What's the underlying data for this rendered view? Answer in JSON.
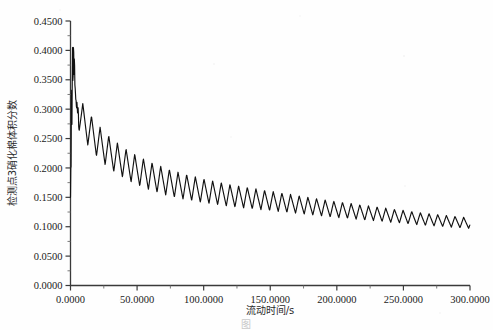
{
  "figure": {
    "background_color": "#fefefe",
    "ink_color": "#111111",
    "axis_color": "#3a3a3a",
    "caption_partial": "图"
  },
  "chart_data": {
    "type": "line",
    "title": "",
    "xlabel": "流动时间/s",
    "ylabel": "检测点3硝化棉体积分数",
    "xlim": [
      0,
      300
    ],
    "ylim": [
      0.0,
      0.45
    ],
    "grid": false,
    "legend": null,
    "x_ticks": [
      0,
      50,
      100,
      150,
      200,
      250,
      300
    ],
    "x_tick_labels": [
      "0.0000",
      "50.0000",
      "100.0000",
      "150.0000",
      "200.0000",
      "250.0000",
      "300.0000"
    ],
    "x_minor_tick_count_between": 1,
    "y_ticks": [
      0.0,
      0.05,
      0.1,
      0.15,
      0.2,
      0.25,
      0.3,
      0.35,
      0.4,
      0.45
    ],
    "y_tick_labels": [
      "0.0000",
      "0.0500",
      "0.1000",
      "0.1500",
      "0.2000",
      "0.2500",
      "0.3000",
      "0.3500",
      "0.4000",
      "0.4500"
    ],
    "series": [
      {
        "name": "检测点3硝化棉体积分数",
        "description": "Sharp startup transient rising to a peak near 0.405, followed by an oscillating exponential decay whose mean falls from about 0.28 to about 0.105 over 300 s.",
        "x": [
          0.0,
          0.6,
          1.2,
          1.8,
          2.4,
          3.0,
          3.6,
          4.2,
          4.8,
          5.4,
          6.0,
          6.6,
          7.2,
          7.8,
          8.4,
          9.0,
          9.6,
          10.2,
          10.8,
          11.4,
          12.0,
          13.0,
          14.0,
          15.0,
          16.0,
          17.0,
          18.0,
          19.0,
          20.0,
          22.0,
          24.0,
          26.0,
          28.0,
          30.0,
          34.0,
          38.0,
          42.0,
          46.0,
          50.0,
          58.0,
          66.0,
          74.0,
          82.0,
          90.0,
          100.0,
          110.0,
          120.0,
          130.0,
          140.0,
          150.0,
          160.0,
          170.0,
          180.0,
          190.0,
          200.0,
          210.0,
          220.0,
          230.0,
          240.0,
          250.0,
          260.0,
          270.0,
          280.0,
          290.0,
          300.0
        ],
        "y_mean_envelope": [
          0.15,
          0.27,
          0.34,
          0.38,
          0.395,
          0.37,
          0.33,
          0.31,
          0.305,
          0.3,
          0.296,
          0.292,
          0.289,
          0.286,
          0.283,
          0.281,
          0.279,
          0.277,
          0.275,
          0.273,
          0.271,
          0.268,
          0.265,
          0.262,
          0.259,
          0.256,
          0.253,
          0.25,
          0.247,
          0.242,
          0.237,
          0.233,
          0.229,
          0.225,
          0.218,
          0.212,
          0.206,
          0.201,
          0.196,
          0.188,
          0.181,
          0.175,
          0.17,
          0.166,
          0.161,
          0.157,
          0.153,
          0.15,
          0.147,
          0.144,
          0.141,
          0.138,
          0.135,
          0.132,
          0.129,
          0.127,
          0.124,
          0.122,
          0.119,
          0.117,
          0.114,
          0.112,
          0.11,
          0.108,
          0.106
        ],
        "oscillation": {
          "period_seconds": 6.5,
          "amplitude_start": 0.03,
          "amplitude_end": 0.009,
          "waveform": "sawtooth-like triangular"
        },
        "startup_spike": {
          "x_range": [
            0.0,
            6.0
          ],
          "y_min": 0.148,
          "y_max": 0.405,
          "note": "dense near-vertical oscillation at t≈0"
        }
      }
    ],
    "notable_values": {
      "peak_y": 0.405,
      "peak_x": 1.5,
      "final_mean_y": 0.106,
      "final_min_y": 0.096,
      "final_max_y": 0.116
    }
  }
}
